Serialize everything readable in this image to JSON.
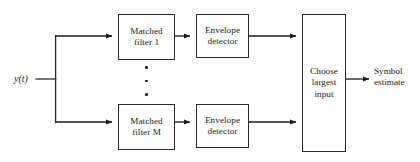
{
  "diagram": {
    "background_color": "#ffffff",
    "stroke_color": "#2a2a2a",
    "text_color": "#1a1a1a",
    "input": {
      "label": "y(t)"
    },
    "output": {
      "label_line_1": "Symbol",
      "label_line_2": "estimate"
    },
    "branches": [
      {
        "id": "branch-1",
        "matched_filter": {
          "line_1": "Matched",
          "line_2": "filter 1"
        },
        "envelope_detector": {
          "line_1": "Envelope",
          "line_2": "detector"
        }
      },
      {
        "id": "branch-m",
        "matched_filter": {
          "line_1": "Matched",
          "line_2": "filter M"
        },
        "envelope_detector": {
          "line_1": "Envelope",
          "line_2": "detector"
        }
      }
    ],
    "decision_block": {
      "line_1": "Choose",
      "line_2": "largest",
      "line_3": "input"
    },
    "ellipsis": {
      "symbol": "vertical-dots",
      "dot_count": 3
    }
  }
}
